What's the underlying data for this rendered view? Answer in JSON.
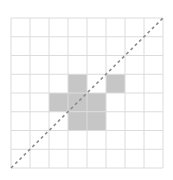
{
  "diagram": {
    "type": "grid-with-diagonal",
    "grid": {
      "columns": 8,
      "rows": 8,
      "origin_x": 11,
      "origin_y": 18,
      "cell_w": 19,
      "cell_h": 18.75,
      "line_color": "#dcdcdc",
      "background": "#ffffff"
    },
    "shaded_cells": [
      {
        "col": 3,
        "row": 3
      },
      {
        "col": 5,
        "row": 3
      },
      {
        "col": 2,
        "row": 4
      },
      {
        "col": 3,
        "row": 4
      },
      {
        "col": 4,
        "row": 4
      },
      {
        "col": 3,
        "row": 5
      },
      {
        "col": 4,
        "row": 5
      }
    ],
    "shade_color": "#c6c6c6",
    "diagonal": {
      "from": "bottom-left",
      "to": "top-right",
      "style": "dashed",
      "color": "#8c8c8c"
    }
  }
}
